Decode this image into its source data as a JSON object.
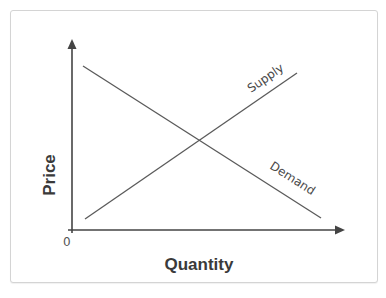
{
  "diagram": {
    "axes": {
      "x_label": "Quantity",
      "y_label": "Price",
      "origin_label": "0"
    },
    "curves": [
      {
        "name": "Supply",
        "label": "Supply",
        "direction": "upward-sloping"
      },
      {
        "name": "Demand",
        "label": "Demand",
        "direction": "downward-sloping"
      }
    ],
    "colors": {
      "axis": "#444444",
      "curve": "#5a5a5a",
      "card_border": "#d4d4d4",
      "text": "#3a3a3a"
    }
  }
}
